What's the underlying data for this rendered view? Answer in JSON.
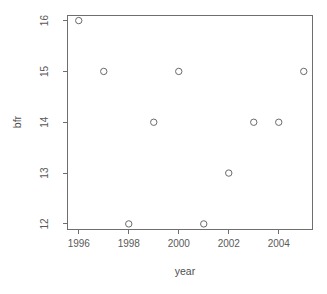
{
  "chart_data": {
    "type": "scatter",
    "title": "",
    "xlabel": "year",
    "ylabel": "bfr",
    "x": [
      1996,
      1997,
      1998,
      1999,
      2000,
      2001,
      2002,
      2003,
      2004,
      2005
    ],
    "values": [
      16,
      15,
      12,
      14,
      15,
      12,
      13,
      14,
      14,
      15
    ],
    "points": [
      {
        "x": 1996,
        "y": 16
      },
      {
        "x": 1997,
        "y": 15
      },
      {
        "x": 1998,
        "y": 12
      },
      {
        "x": 1999,
        "y": 14
      },
      {
        "x": 2000,
        "y": 15
      },
      {
        "x": 2001,
        "y": 12
      },
      {
        "x": 2002,
        "y": 13
      },
      {
        "x": 2003,
        "y": 14
      },
      {
        "x": 2004,
        "y": 14
      },
      {
        "x": 2005,
        "y": 15
      }
    ],
    "xlim": [
      1995.55,
      2005.35
    ],
    "ylim": [
      11.9,
      16.1
    ],
    "xticks": [
      1996,
      1998,
      2000,
      2002,
      2004
    ],
    "xtick_labels": [
      "1996",
      "1998",
      "2000",
      "2002",
      "2004"
    ],
    "yticks": [
      12,
      13,
      14,
      15,
      16
    ],
    "ytick_labels": [
      "12",
      "13",
      "14",
      "15",
      "16"
    ],
    "grid": false,
    "legend": null,
    "marker": "open-circle",
    "marker_color": "#6a6a6a",
    "axis_color": "#6e6e6e",
    "background": "#ffffff"
  }
}
